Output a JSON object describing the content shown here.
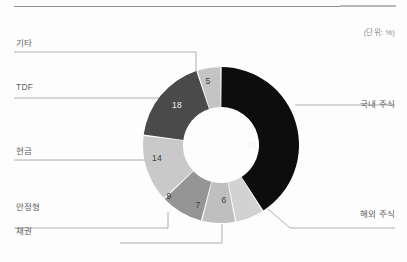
{
  "page": {
    "background_color": "#fdfdfd",
    "rule_color": "#8d8d8d"
  },
  "header": {
    "unit_note": "(단위: %)"
  },
  "chart_data": {
    "type": "pie",
    "variant": "donut",
    "title": "",
    "unit": "%",
    "legend_position": "callout-leader-lines",
    "start_angle_deg": 0,
    "direction": "clockwise",
    "categories": [
      "국내 주식",
      "해외 주식",
      "채권",
      "안정형",
      "현금",
      "TDF",
      "기타"
    ],
    "values": [
      41,
      6,
      7,
      9,
      14,
      18,
      5
    ],
    "colors": [
      "#0d0d0d",
      "#d2d2d2",
      "#bfbfbf",
      "#959595",
      "#c9c9c9",
      "#4a4a4a",
      "#c4c4c4"
    ],
    "label_text_on_dark": [
      true,
      false,
      false,
      false,
      false,
      true,
      false
    ],
    "total": 100,
    "slices": [
      {
        "label": "국내 주식",
        "value": 41,
        "color": "#0d0d0d",
        "value_text": "41",
        "side": "right"
      },
      {
        "label": "해외 주식",
        "value": 6,
        "color": "#d2d2d2",
        "value_text": "6",
        "side": "right"
      },
      {
        "label": "채권",
        "value": 7,
        "color": "#bfbfbf",
        "value_text": "7",
        "side": "bottom"
      },
      {
        "label": "안정형",
        "value": 9,
        "color": "#959595",
        "value_text": "9",
        "side": "left"
      },
      {
        "label": "현금",
        "value": 14,
        "color": "#c9c9c9",
        "value_text": "14",
        "side": "left"
      },
      {
        "label": "TDF",
        "value": 18,
        "color": "#4a4a4a",
        "value_text": "18",
        "side": "left"
      },
      {
        "label": "기타",
        "value": 5,
        "color": "#c4c4c4",
        "value_text": "5",
        "side": "left"
      }
    ]
  },
  "labels": {
    "etc": "기타",
    "tdf": "TDF",
    "cash": "현금",
    "stable": "안정형",
    "bond": "채권",
    "domestic_equity": "국내 주식",
    "overseas_equity": "해외 주식"
  },
  "values": {
    "domestic_equity": "41",
    "overseas_equity": "6",
    "bond": "7",
    "stable": "9",
    "cash": "14",
    "tdf": "18",
    "etc": "5"
  }
}
